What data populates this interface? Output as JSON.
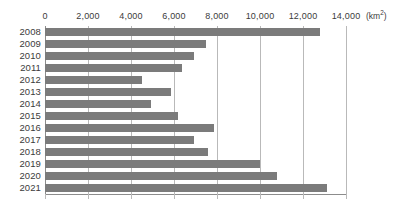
{
  "chart_data": {
    "type": "bar",
    "orientation": "horizontal",
    "title": "",
    "xlabel": "(km²)",
    "ylabel": "",
    "xlim": [
      0,
      14000
    ],
    "xticks": [
      0,
      2000,
      4000,
      6000,
      8000,
      10000,
      12000,
      14000
    ],
    "xtick_labels": [
      "0",
      "2,000",
      "4,000",
      "6,000",
      "8,000",
      "10,000",
      "12,000",
      "14,000"
    ],
    "unit_label": "(km²)",
    "grid": true,
    "legend": "none",
    "categories": [
      "2008",
      "2009",
      "2010",
      "2011",
      "2012",
      "2013",
      "2014",
      "2015",
      "2016",
      "2017",
      "2018",
      "2019",
      "2020",
      "2021"
    ],
    "values": [
      12800,
      7500,
      6950,
      6350,
      4500,
      5850,
      4950,
      6200,
      7850,
      6950,
      7600,
      10000,
      10800,
      13100
    ],
    "bar_color": "#7b7b7b",
    "gridline_color": "#b9b9b9",
    "axis_color": "#8c8c8c",
    "text_color": "#3b3b3b",
    "background": "#ffffff"
  }
}
